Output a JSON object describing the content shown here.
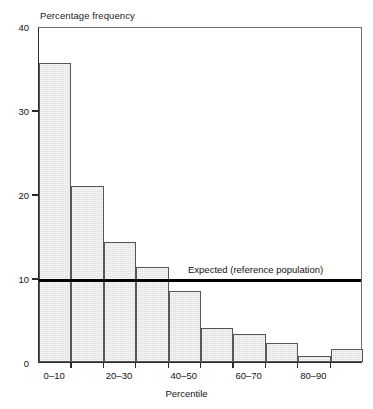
{
  "chart_data": {
    "type": "bar",
    "title": "",
    "ylabel": "Percentage frequency",
    "xlabel": "Percentile",
    "ylim": [
      0,
      40
    ],
    "yticks": [
      0,
      10,
      20,
      30,
      40
    ],
    "ytick_labels": [
      "0",
      "10",
      "20",
      "30",
      "40"
    ],
    "grid": false,
    "legend": "none",
    "categories": [
      "0–10",
      "10–20",
      "20–30",
      "30–40",
      "40–50",
      "50–60",
      "60–70",
      "70–80",
      "80–90",
      "90–100"
    ],
    "xtick_labels": [
      "0–10",
      "20–30",
      "40–50",
      "60–70",
      "80–90"
    ],
    "xtick_label_bins": [
      0,
      2,
      4,
      6,
      8
    ],
    "values": [
      35.6,
      21.0,
      14.3,
      11.3,
      8.4,
      4.1,
      3.3,
      2.3,
      0.7,
      1.5
    ],
    "annotations": [
      {
        "text": "Expected (reference population)",
        "value": 10,
        "kind": "reference-line"
      }
    ]
  },
  "colors": {
    "bar_fill": "#dededd",
    "bar_edge": "#56565a",
    "axis": "#2b2b2b",
    "reference_line": "#000000",
    "text": "#141414"
  }
}
